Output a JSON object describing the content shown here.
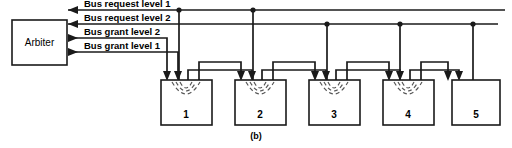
{
  "figure": {
    "caption": "(b)",
    "arbiter": {
      "label": "Arbiter"
    },
    "bus_lines": [
      {
        "id": "bus-request-level-1",
        "label": "Bus request level 1",
        "direction": "to-arbiter",
        "y": 10
      },
      {
        "id": "bus-request-level-2",
        "label": "Bus request level 2",
        "direction": "to-arbiter",
        "y": 24
      },
      {
        "id": "bus-grant-level-2",
        "label": "Bus grant level 2",
        "direction": "from-arbiter",
        "y": 38
      },
      {
        "id": "bus-grant-level-1",
        "label": "Bus grant level 1",
        "direction": "from-arbiter",
        "y": 52
      }
    ],
    "devices": [
      {
        "number": "1",
        "has_arcs": true
      },
      {
        "number": "2",
        "has_arcs": true
      },
      {
        "number": "3",
        "has_arcs": true
      },
      {
        "number": "4",
        "has_arcs": true
      },
      {
        "number": "5",
        "has_arcs": false
      }
    ],
    "colors": {
      "wire": "#1a1a1a",
      "arc": "#555555",
      "background": "#ffffff",
      "text": "#000000"
    }
  }
}
